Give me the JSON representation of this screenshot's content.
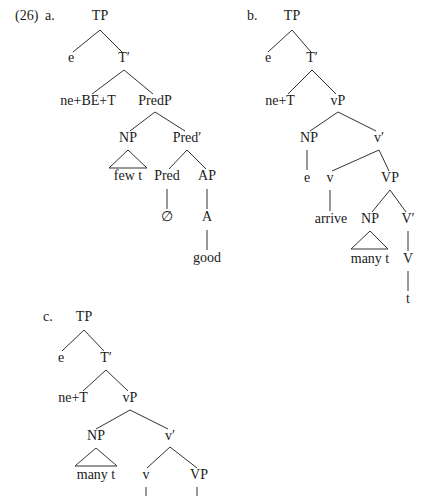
{
  "example_number": "(26)",
  "trees": [
    {
      "label": "a.",
      "nodes": {
        "TP": "TP",
        "e": "e",
        "Tbar": "T′",
        "head": "ne+BE+T",
        "PredP": "PredP",
        "NP": "NP",
        "Predbar": "Pred′",
        "NP_content": "few t",
        "Pred": "Pred",
        "AP": "AP",
        "null": "∅",
        "A": "A",
        "good": "good"
      }
    },
    {
      "label": "b.",
      "nodes": {
        "TP": "TP",
        "e": "e",
        "Tbar": "T′",
        "head": "ne+T",
        "vP": "vP",
        "NP": "NP",
        "vbar": "v′",
        "NP_e": "e",
        "v": "v",
        "VP": "VP",
        "arrive": "arrive",
        "NP2": "NP",
        "Vbar": "V′",
        "NP2_content": "many t",
        "V": "V",
        "t": "t"
      }
    },
    {
      "label": "c.",
      "nodes": {
        "TP": "TP",
        "e": "e",
        "Tbar": "T′",
        "head": "ne+T",
        "vP": "vP",
        "NP": "NP",
        "vbar": "v′",
        "NP_content": "many t",
        "v": "v",
        "VP": "VP"
      }
    }
  ]
}
